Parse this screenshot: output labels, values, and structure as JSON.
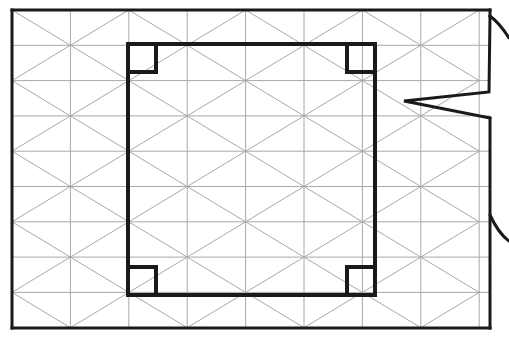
{
  "canvas": {
    "width": 509,
    "height": 338,
    "background": "#ffffff",
    "title": "Triangular grid panel with inner rectangular frame and corner notches"
  },
  "colors": {
    "grid_line": "#a8a8a8",
    "outline": "#1a1a1a",
    "inner_frame": "#1a1a1a",
    "background": "#ffffff"
  },
  "strokes": {
    "grid_width": 1,
    "outer_width": 3,
    "inner_width": 4,
    "notch_width": 4,
    "break_width": 3
  },
  "outer_frame": {
    "name": "outer-panel-boundary",
    "left": 12,
    "top": 10,
    "right": 490,
    "bottom": 328,
    "description": "Panel outline, right edge interrupted by a break symbol"
  },
  "grid": {
    "name": "triangular-mesh",
    "type": "triangular",
    "x_start": 12,
    "x_spacing": 58.4,
    "x_count": 9,
    "y_start": 10,
    "y_spacing": 35.3,
    "y_count": 10,
    "has_vertical_lines": true,
    "has_horizontal_lines": true,
    "has_diagonals": true,
    "diagonal_direction": "alternating"
  },
  "inner_frame": {
    "name": "inner-rectangle",
    "left": 128,
    "top": 44,
    "right": 375,
    "bottom": 295,
    "width": 247,
    "height": 251
  },
  "corner_notches": {
    "name": "corner-notch-set",
    "size": 28,
    "count": 4,
    "items": [
      {
        "position": "top-left",
        "x": 128,
        "y": 44,
        "size": 28
      },
      {
        "position": "top-right",
        "x": 375,
        "y": 44,
        "size": 28
      },
      {
        "position": "bottom-left",
        "x": 128,
        "y": 295,
        "size": 28
      },
      {
        "position": "bottom-right",
        "x": 375,
        "y": 295,
        "size": 28
      }
    ]
  },
  "break_symbol": {
    "name": "edge-break-zigzag",
    "description": "Zigzag break on the right boundary indicating a truncated view",
    "points": "490,16 489,92 404,101 490,118",
    "upper_tail": "M 490,16 C 498,22 504,30 509,38",
    "lower_tail": "M 490,215 C 496,228 502,236 509,241",
    "tail_y_upper": 16,
    "tail_y_lower": 215
  },
  "right_edge_segments": [
    {
      "name": "right-edge-upper",
      "x": 490,
      "y1": 10,
      "y2": 16
    },
    {
      "name": "right-edge-lower",
      "x": 490,
      "y1": 118,
      "y2": 328
    }
  ]
}
